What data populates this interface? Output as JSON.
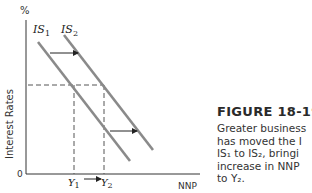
{
  "diagram": {
    "y_axis_unit": "%",
    "y_axis_label": "Interest Rates",
    "x_axis_label": "NNP",
    "origin_label": "0",
    "curves": [
      {
        "name": "IS1",
        "label_base": "IS",
        "label_sub": "1"
      },
      {
        "name": "IS2",
        "label_base": "IS",
        "label_sub": "2"
      }
    ],
    "x_ticks": [
      {
        "base": "Y",
        "sub": "1"
      },
      {
        "base": "Y",
        "sub": "2"
      }
    ],
    "shift_direction": "right",
    "colors": {
      "curve": "#8a8a8a",
      "axis": "#333333",
      "arrow": "#222222",
      "dashed": "#555555"
    }
  },
  "caption": {
    "figure_number": "FIGURE 18-19",
    "lines": [
      "Greater business",
      "has moved the I",
      "IS₁ to IS₂, bringi",
      "increase in NNP",
      "to Y₂."
    ]
  }
}
